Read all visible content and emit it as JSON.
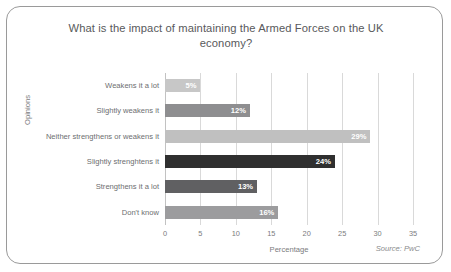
{
  "card": {
    "source_note": "Source: PwC"
  },
  "chart_data": {
    "type": "bar",
    "orientation": "horizontal",
    "title": "What is the impact of maintaining the Armed Forces on the UK economy?",
    "xlabel": "Percentage",
    "ylabel": "Opinions",
    "xlim": [
      0,
      35
    ],
    "xticks": [
      "0",
      "5",
      "10",
      "15",
      "20",
      "25",
      "30",
      "35"
    ],
    "grid": "vertical",
    "legend": "none",
    "categories": [
      "Weakens it a lot",
      "Slightly weakens it",
      "Neither strengthens or weakens it",
      "Slightly strenghtens it",
      "Strengthens it a lot",
      "Don't know"
    ],
    "values": [
      5,
      12,
      29,
      24,
      13,
      16
    ],
    "value_labels": [
      "5%",
      "12%",
      "29%",
      "24%",
      "13%",
      "16%"
    ],
    "bar_colors": [
      "#c7c7c7",
      "#8e8e90",
      "#c0c0c0",
      "#2f2f2f",
      "#606062",
      "#9c9c9e"
    ]
  }
}
